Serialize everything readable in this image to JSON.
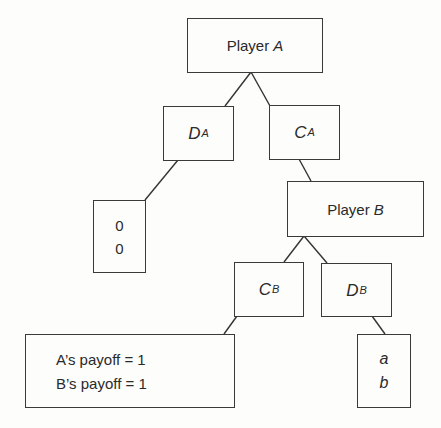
{
  "diagram": {
    "type": "game-tree",
    "root": {
      "label_prefix": "Player ",
      "label_var": "A"
    },
    "player_a_actions": {
      "defect": {
        "main": "D",
        "sub": "A"
      },
      "cooperate": {
        "main": "C",
        "sub": "A"
      }
    },
    "defect_outcome": {
      "line1": "0",
      "line2": "0"
    },
    "player_b": {
      "label_prefix": "Player ",
      "label_var": "B"
    },
    "player_b_actions": {
      "cooperate": {
        "main": "C",
        "sub": "B"
      },
      "defect": {
        "main": "D",
        "sub": "B"
      }
    },
    "cooperate_outcome": {
      "line1": "A’s payoff = 1",
      "line2": "B’s payoff = 1"
    },
    "betray_outcome": {
      "line1": "a",
      "line2": "b"
    },
    "colors": {
      "stroke": "#333333",
      "background": "#fdfdfc",
      "text": "#2a2a2a"
    }
  }
}
